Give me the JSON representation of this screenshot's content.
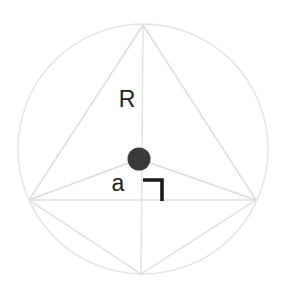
{
  "figure": {
    "background_color": "#ffffff",
    "width": 282,
    "height": 293,
    "colors": {
      "circle_stroke": "#e2e2e2",
      "polygon_stroke": "#dcdcdc",
      "axis_stroke": "#e0e0e0",
      "center_dot_fill": "#3a3a3a",
      "label_color": "#231f20",
      "right_angle_color": "#1a1a1a"
    },
    "circle": {
      "name": "circumscribed-circle",
      "center_x": 143,
      "center_y": 149,
      "radius": 125,
      "stroke_width": 1.4
    },
    "vertices": [
      {
        "name": "top-vertex",
        "x": 143,
        "y": 25
      },
      {
        "name": "right-vertex",
        "x": 256,
        "y": 200
      },
      {
        "name": "bottom-vertex",
        "x": 141,
        "y": 274
      },
      {
        "name": "left-vertex",
        "x": 29,
        "y": 200
      }
    ],
    "center_dot": {
      "name": "centroid-point",
      "x": 139,
      "y": 159,
      "radius": 11.5
    },
    "labels": {
      "radius": {
        "text": "R",
        "x": 127,
        "y": 107,
        "font_size": 23
      },
      "apothem": {
        "text": "a",
        "x": 118,
        "y": 191,
        "font_size": 23
      }
    },
    "right_angle_marker": {
      "name": "right-angle-marker",
      "corner_x": 162,
      "corner_y": 180,
      "vertical_end_y": 201,
      "horizontal_start_x": 143,
      "stroke_width": 3.6
    },
    "edges": [
      {
        "name": "edge-top-to-left",
        "x1": 143,
        "y1": 25,
        "x2": 29,
        "y2": 200
      },
      {
        "name": "edge-top-to-right",
        "x1": 143,
        "y1": 25,
        "x2": 256,
        "y2": 200
      },
      {
        "name": "edge-bottom-to-left",
        "x1": 141,
        "y1": 274,
        "x2": 29,
        "y2": 200
      },
      {
        "name": "edge-bottom-to-right",
        "x1": 141,
        "y1": 274,
        "x2": 256,
        "y2": 200
      },
      {
        "name": "diagonal-horizontal",
        "x1": 29,
        "y1": 200,
        "x2": 256,
        "y2": 200
      },
      {
        "name": "diagonal-vertical",
        "x1": 143,
        "y1": 25,
        "x2": 141,
        "y2": 274
      },
      {
        "name": "radius-dot-to-left",
        "x1": 139,
        "y1": 159,
        "x2": 29,
        "y2": 200
      },
      {
        "name": "radius-dot-to-right",
        "x1": 139,
        "y1": 159,
        "x2": 256,
        "y2": 200
      }
    ]
  }
}
